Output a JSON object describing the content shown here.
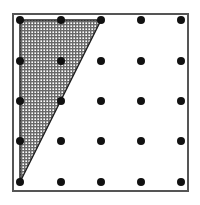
{
  "figure": {
    "frame": {
      "x": 13,
      "y": 14,
      "width": 175,
      "height": 177,
      "stroke": "#555555"
    },
    "grid": {
      "columns": 5,
      "rows": 5,
      "x_positions": [
        20,
        61,
        101,
        141,
        181
      ],
      "y_positions": [
        20,
        61,
        101,
        141,
        182
      ],
      "dot_radius": 4,
      "dot_color": "#111111"
    },
    "shaded_triangle": {
      "vertices": [
        [
          20,
          20
        ],
        [
          101,
          20
        ],
        [
          20,
          182
        ]
      ],
      "grid_vertices": [
        [
          0,
          0
        ],
        [
          2,
          0
        ],
        [
          0,
          4
        ]
      ],
      "fill_pattern": "dotted-crosshatch",
      "stroke": "#222222"
    }
  }
}
